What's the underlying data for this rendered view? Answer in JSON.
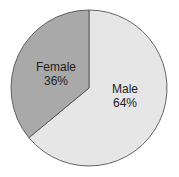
{
  "chart_data": {
    "type": "pie",
    "title": "",
    "categories": [
      "Male",
      "Female"
    ],
    "values": [
      64,
      36
    ],
    "labels": [
      "Male 64%",
      "Female 36%"
    ],
    "colors": [
      "#e6e6e6",
      "#a9a9a9"
    ],
    "outline_color": "#555555",
    "start_angle": "12 o'clock",
    "direction": "Male clockwise from top, Female counterclockwise from top",
    "legend": "none (labels inside slices)"
  },
  "slices": [
    {
      "name": "Male",
      "label": "Male",
      "percent": "64%",
      "value": 64,
      "color": "#e6e6e6"
    },
    {
      "name": "Female",
      "label": "Female",
      "percent": "36%",
      "value": 36,
      "color": "#a9a9a9"
    }
  ]
}
